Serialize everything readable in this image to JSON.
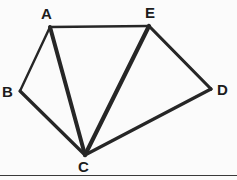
{
  "figure": {
    "background_color": "#fbfbfb",
    "stroke_color": "#262626",
    "label_color": "#1c1c1c",
    "canvas": {
      "width": 237,
      "height": 180
    },
    "vertices": [
      {
        "id": "A",
        "label": "A",
        "x": 50,
        "y": 27,
        "label_x": 41,
        "label_y": 6
      },
      {
        "id": "B",
        "label": "B",
        "x": 20,
        "y": 91,
        "label_x": 2,
        "label_y": 84
      },
      {
        "id": "C",
        "label": "C",
        "x": 85,
        "y": 155,
        "label_x": 78,
        "label_y": 159
      },
      {
        "id": "D",
        "label": "D",
        "x": 211,
        "y": 89,
        "label_x": 217,
        "label_y": 82
      },
      {
        "id": "E",
        "label": "E",
        "x": 149,
        "y": 26,
        "label_x": 145,
        "label_y": 5
      }
    ],
    "edges": [
      {
        "id": "A-E",
        "from": "A",
        "to": "E",
        "width": 2.4
      },
      {
        "id": "A-B",
        "from": "A",
        "to": "B",
        "width": 2.4
      },
      {
        "id": "A-C",
        "from": "A",
        "to": "C",
        "width": 4.0
      },
      {
        "id": "B-C",
        "from": "B",
        "to": "C",
        "width": 3.2
      },
      {
        "id": "E-C",
        "from": "E",
        "to": "C",
        "width": 4.2
      },
      {
        "id": "E-D",
        "from": "E",
        "to": "D",
        "width": 3.2
      },
      {
        "id": "C-D",
        "from": "C",
        "to": "D",
        "width": 3.2
      }
    ],
    "baseline_rule": {
      "y": 175,
      "color": "#3a3a3a"
    }
  }
}
